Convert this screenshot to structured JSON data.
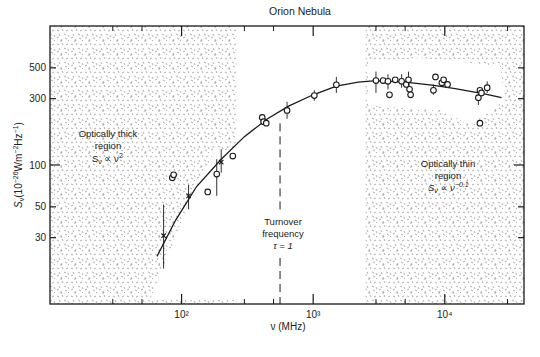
{
  "chart_data": {
    "type": "scatter",
    "title": "Orion Nebula",
    "xlabel": "ν (MHz)",
    "ylabel": "S_ν (10^-26 Wm^-2 Hz^-1)",
    "xscale": "log",
    "yscale": "log",
    "xlim": [
      10,
      40000
    ],
    "ylim": [
      10,
      1000
    ],
    "x_major_ticks": [
      100,
      1000,
      10000
    ],
    "x_major_tick_labels": [
      "10²",
      "10³",
      "10⁴"
    ],
    "x_minor_ticks": [
      30,
      50,
      300,
      500,
      3000,
      5000,
      30000
    ],
    "y_ticks": [
      30,
      50,
      100,
      300,
      500
    ],
    "y_tick_labels": [
      "30",
      "50",
      "100",
      "300",
      "500"
    ],
    "grid": false,
    "legend": null,
    "series": [
      {
        "name": "measurements (cross)",
        "marker": "x",
        "points": [
          {
            "x": 73,
            "y": 31,
            "err_low": 18,
            "err_high": 52
          },
          {
            "x": 113,
            "y": 60,
            "err_low": 48,
            "err_high": 72
          },
          {
            "x": 200,
            "y": 105,
            "err_low": 88,
            "err_high": 130
          }
        ]
      },
      {
        "name": "measurements (circle)",
        "marker": "o",
        "points": [
          {
            "x": 85,
            "y": 81
          },
          {
            "x": 87,
            "y": 85
          },
          {
            "x": 158,
            "y": 64
          },
          {
            "x": 185,
            "y": 86,
            "err_low": 60,
            "err_high": 110
          },
          {
            "x": 245,
            "y": 116
          },
          {
            "x": 410,
            "y": 220
          },
          {
            "x": 420,
            "y": 205
          },
          {
            "x": 440,
            "y": 200
          },
          {
            "x": 633,
            "y": 247,
            "err_low": 215,
            "err_high": 285
          },
          {
            "x": 1020,
            "y": 316,
            "err_low": 290,
            "err_high": 345
          },
          {
            "x": 1500,
            "y": 378,
            "err_low": 330,
            "err_high": 430
          },
          {
            "x": 3000,
            "y": 405,
            "err_low": 330,
            "err_high": 470
          },
          {
            "x": 3400,
            "y": 405
          },
          {
            "x": 3700,
            "y": 400,
            "err_low": 350,
            "err_high": 450
          },
          {
            "x": 3800,
            "y": 320
          },
          {
            "x": 4200,
            "y": 410
          },
          {
            "x": 4700,
            "y": 400,
            "err_low": 360,
            "err_high": 450
          },
          {
            "x": 5100,
            "y": 380
          },
          {
            "x": 5300,
            "y": 410,
            "err_low": 370,
            "err_high": 470
          },
          {
            "x": 5400,
            "y": 350
          },
          {
            "x": 5500,
            "y": 320
          },
          {
            "x": 8500,
            "y": 430
          },
          {
            "x": 9500,
            "y": 390
          },
          {
            "x": 9800,
            "y": 410
          },
          {
            "x": 10500,
            "y": 380
          },
          {
            "x": 8200,
            "y": 345,
            "err_low": 320,
            "err_high": 380
          },
          {
            "x": 18000,
            "y": 305,
            "err_low": 270,
            "err_high": 340
          },
          {
            "x": 18500,
            "y": 345
          },
          {
            "x": 19000,
            "y": 330
          },
          {
            "x": 21000,
            "y": 360,
            "err_low": 330,
            "err_high": 400
          },
          {
            "x": 18500,
            "y": 200
          }
        ]
      }
    ],
    "fit_curve": {
      "name": "thermal bremsstrahlung fit",
      "points": [
        [
          65,
          22
        ],
        [
          90,
          40
        ],
        [
          130,
          70
        ],
        [
          200,
          110
        ],
        [
          300,
          160
        ],
        [
          450,
          215
        ],
        [
          650,
          265
        ],
        [
          1000,
          320
        ],
        [
          1500,
          370
        ],
        [
          2200,
          395
        ],
        [
          3000,
          405
        ],
        [
          5000,
          395
        ],
        [
          8000,
          375
        ],
        [
          12000,
          355
        ],
        [
          20000,
          325
        ],
        [
          27000,
          305
        ]
      ]
    },
    "turnover_line": {
      "x": 560,
      "y_from": 10,
      "y_to": 220
    },
    "regions": [
      {
        "name": "Optically thick region",
        "x_range": [
          10,
          260
        ]
      },
      {
        "name": "Optically thin region",
        "x_range": [
          2500,
          40000
        ]
      }
    ],
    "annotations": [
      {
        "lines": [
          "Optically thick",
          "region",
          "S_ν ∝ ν²"
        ],
        "x": 55,
        "y": 135
      },
      {
        "lines": [
          "Turnover",
          "frequency",
          "τ = 1"
        ],
        "x": 560,
        "y": 22
      },
      {
        "lines": [
          "Optically thin",
          "region",
          "S_ν ∝ ν^−0.1"
        ],
        "x": 14000,
        "y": 95
      }
    ]
  },
  "labels": {
    "title": "Orion Nebula",
    "xlabel": "ν (MHz)",
    "ylabel": "S",
    "ylabel_sub": "ν",
    "ylabel_rest": "(10",
    "ylabel_exp1": "−26",
    "ylabel_mid": "Wm",
    "ylabel_exp2": "−2",
    "ylabel_hz": "Hz",
    "ylabel_exp3": "−1",
    "ylabel_close": ")",
    "thick": [
      "Optically thick",
      "region",
      "S",
      "ν",
      " ∝ ν",
      "2"
    ],
    "turnover": [
      "Turnover",
      "frequency",
      "τ = 1"
    ],
    "thin": [
      "Optically thin",
      "region",
      "S",
      "ν",
      " ∝ ν",
      "−0.1"
    ]
  },
  "colors": {
    "ink": "#1a1a1a",
    "stipple": "#8a8a8a",
    "background": "#ffffff"
  }
}
